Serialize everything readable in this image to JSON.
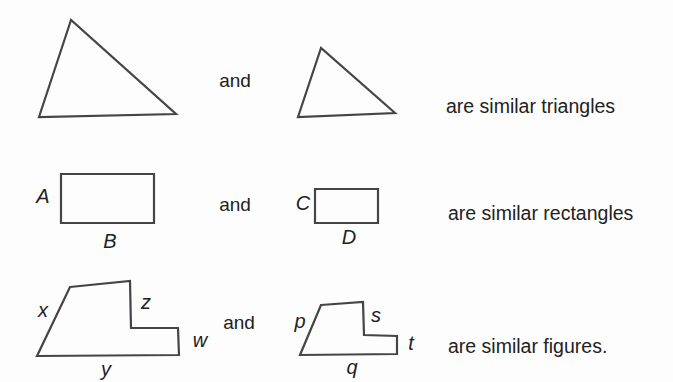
{
  "colors": {
    "background": "#fdfdfd",
    "stroke": "#454545",
    "text": "#222222"
  },
  "rows": [
    {
      "shapes": [
        "large-triangle",
        "small-triangle"
      ],
      "connector": "and",
      "caption": "are similar triangles"
    },
    {
      "shapes": [
        "large-rectangle",
        "small-rectangle"
      ],
      "connector": "and",
      "caption": "are similar rectangles",
      "left_rect": {
        "side": "A",
        "bottom": "B"
      },
      "right_rect": {
        "side": "C",
        "bottom": "D"
      }
    },
    {
      "shapes": [
        "large-step-figure",
        "small-step-figure"
      ],
      "connector": "and",
      "caption": "are similar figures.",
      "left_figure": {
        "left_side": "x",
        "step_side": "z",
        "right_side": "w",
        "bottom": "y"
      },
      "right_figure": {
        "left_side": "p",
        "step_side": "s",
        "right_side": "t",
        "bottom": "q"
      }
    }
  ]
}
